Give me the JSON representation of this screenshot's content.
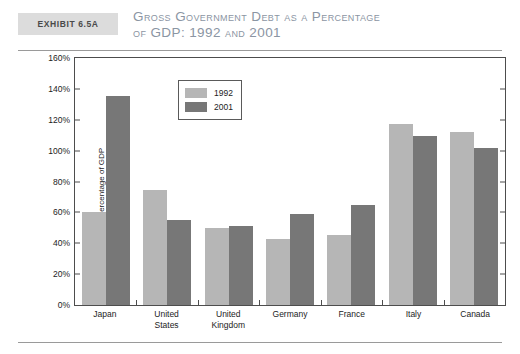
{
  "exhibit": {
    "label": "Exhibit 6.5A",
    "title_line1": "Gross Government Debt as a Percentage",
    "title_line2": "of GDP: 1992 and 2001"
  },
  "colors": {
    "series_1992": "#b6b6b6",
    "series_2001": "#777777",
    "exhibit_box": "#dcdcdc",
    "title_text": "#8b95a3",
    "axis": "#4d4d4d"
  },
  "chart_data": {
    "type": "bar",
    "title": "Gross Government Debt as a Percentage of GDP: 1992 and 2001",
    "xlabel": "",
    "ylabel": "Percentage of GDP",
    "ylim": [
      0,
      160
    ],
    "ytick_labels": [
      "0%",
      "20%",
      "40%",
      "60%",
      "80%",
      "100%",
      "120%",
      "140%",
      "160%"
    ],
    "ytick_values": [
      0,
      20,
      40,
      60,
      80,
      100,
      120,
      140,
      160
    ],
    "grid": false,
    "legend_position": "upper-left-inside",
    "categories": [
      "Japan",
      "United States",
      "United Kingdom",
      "Germany",
      "France",
      "Italy",
      "Canada"
    ],
    "category_lines": [
      [
        "Japan"
      ],
      [
        "United",
        "States"
      ],
      [
        "United",
        "Kingdom"
      ],
      [
        "Germany"
      ],
      [
        "France"
      ],
      [
        "Italy"
      ],
      [
        "Canada"
      ]
    ],
    "series": [
      {
        "name": "1992",
        "values": [
          60,
          74.5,
          50,
          42.5,
          45.5,
          117,
          112
        ]
      },
      {
        "name": "2001",
        "values": [
          135.5,
          55,
          51.5,
          59,
          64.5,
          109.5,
          102
        ]
      }
    ]
  }
}
